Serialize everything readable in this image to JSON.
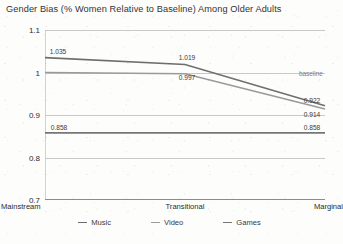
{
  "chart_data": {
    "type": "line",
    "title": "Gender Bias (% Women Relative to Baseline) Among Older Adults",
    "xlabel": "",
    "ylabel": "",
    "categories": [
      "Mainstream",
      "Transitional",
      "Marginal"
    ],
    "ylim": [
      0.7,
      1.1
    ],
    "yticks": [
      "0.7",
      "0.8",
      "0.9",
      "1",
      "1.1"
    ],
    "grid": true,
    "legend_position": "bottom",
    "series": [
      {
        "name": "Music",
        "values": [
          1.035,
          1.019,
          0.922
        ],
        "color": "#6e6e6e",
        "labels": [
          "1.035",
          "1.019",
          "0.922"
        ]
      },
      {
        "name": "Video",
        "values": [
          1.0,
          0.997,
          0.914
        ],
        "color": "#9a9a9a",
        "labels": [
          "",
          "0.997",
          "0.914"
        ]
      },
      {
        "name": "Games",
        "values": [
          0.858,
          0.858,
          0.858
        ],
        "color": "#767676",
        "labels": [
          "0.858",
          "",
          "0.858"
        ]
      }
    ],
    "annotations": [
      {
        "text": "baseline",
        "value": 1.0,
        "color": "#6f7f99"
      }
    ]
  }
}
